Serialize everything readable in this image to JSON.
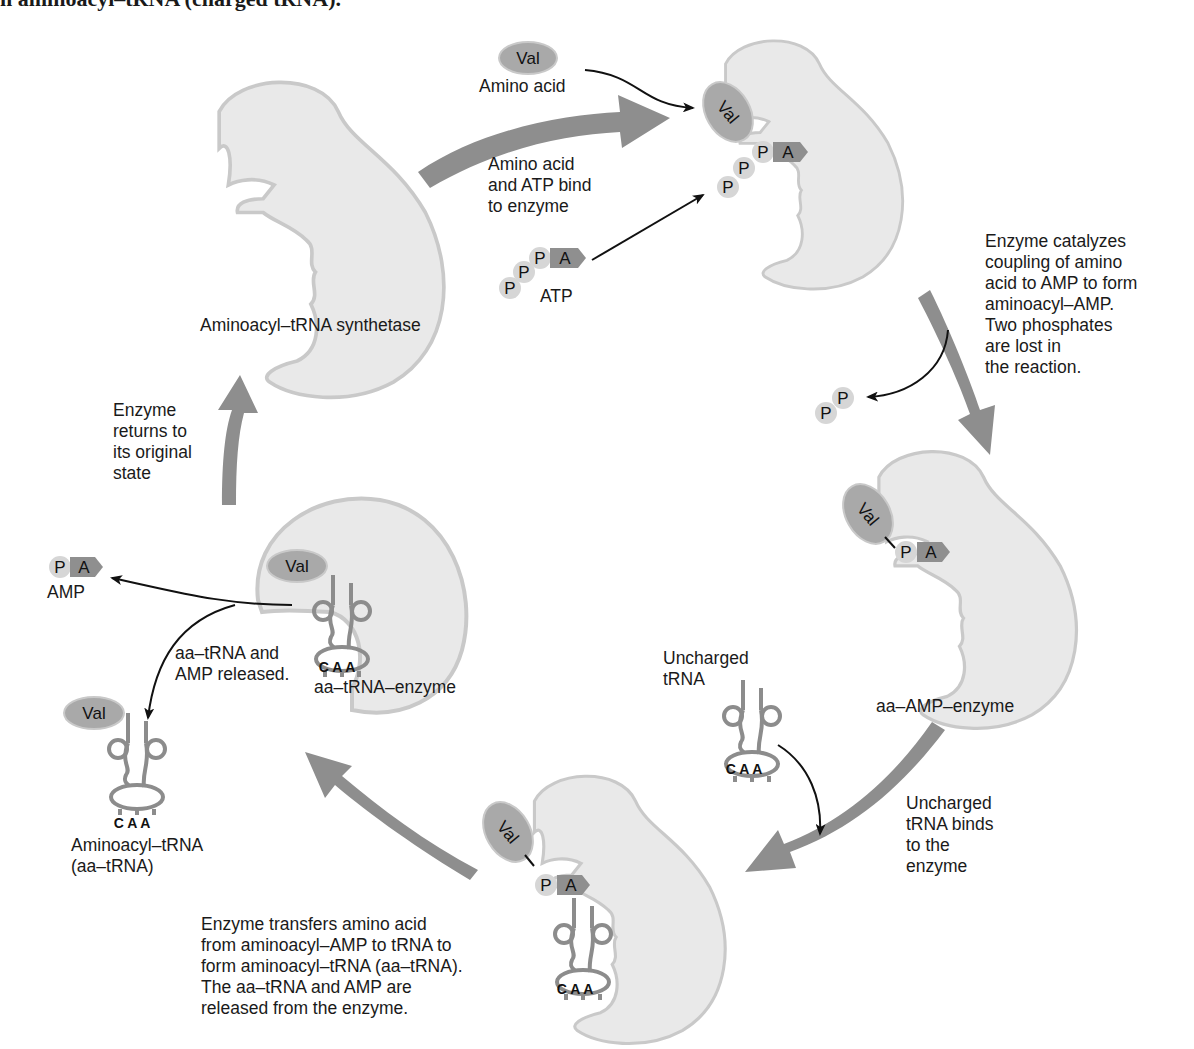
{
  "header": {
    "caption_fragment": "n aminoacyl–tRNA (charged tRNA)."
  },
  "colors": {
    "enzyme_fill": "#e9e9e9",
    "enzyme_edge": "#c9c9c9",
    "cycle_arrow": "#8e8e8e",
    "val_fill": "#a9a9a9",
    "amp_fill": "#8f8f8f",
    "phosphate_fill": "#d6d6d6",
    "trna_stroke": "#8c8c8c",
    "text": "#1a1a1a"
  },
  "molecules": {
    "val": "Val",
    "phosphate": "P",
    "adenosine": "A",
    "anticodon": "C A A"
  },
  "stages": {
    "synthetase": {
      "label": "Aminoacyl–tRNA synthetase"
    },
    "aa_amp_enzyme": {
      "label": "aa–AMP–enzyme"
    },
    "aa_trna_enzyme": {
      "label": "aa–tRNA–enzyme"
    }
  },
  "inputs": {
    "amino_acid": "Amino acid",
    "atp": "ATP",
    "uncharged_trna": "Uncharged\ntRNA",
    "amp": "AMP",
    "aminoacyl_trna": "Aminoacyl–tRNA\n(aa–tRNA)"
  },
  "steps": [
    {
      "id": "bind",
      "text": "Amino acid\nand ATP bind\nto enzyme"
    },
    {
      "id": "couple",
      "text": "Enzyme catalyzes\ncoupling of amino\nacid to AMP to form\naminoacyl–AMP.\nTwo phosphates\nare lost in\nthe reaction."
    },
    {
      "id": "trna_bind",
      "text": "Uncharged\ntRNA binds\nto the\nenzyme"
    },
    {
      "id": "transfer",
      "text": "Enzyme transfers amino acid\nfrom aminoacyl–AMP to tRNA to\nform aminoacyl–tRNA (aa–tRNA).\nThe aa–tRNA and AMP are\nreleased from the enzyme."
    },
    {
      "id": "release",
      "text": "aa–tRNA and\nAMP released."
    },
    {
      "id": "return",
      "text": "Enzyme\nreturns to\nits original\nstate"
    }
  ]
}
